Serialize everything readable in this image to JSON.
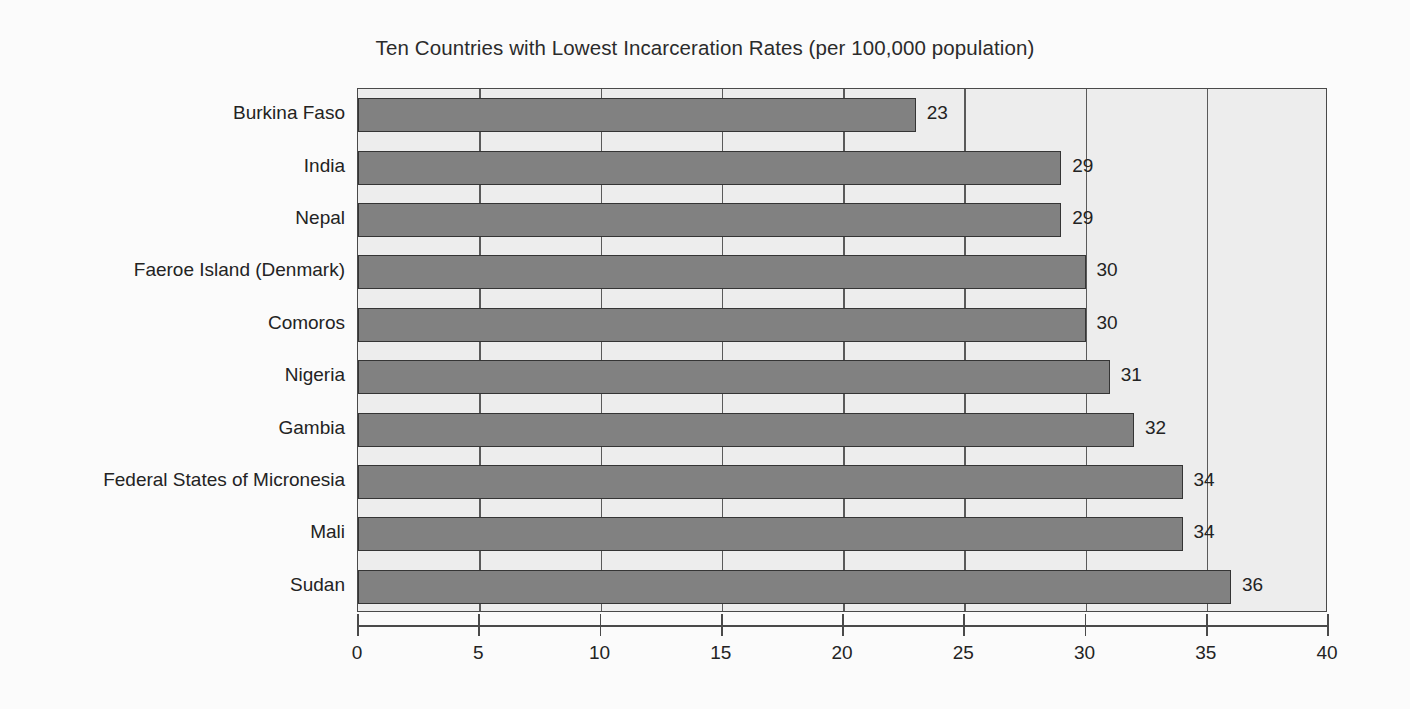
{
  "chart_data": {
    "type": "bar",
    "orientation": "horizontal",
    "title": "Ten Countries with Lowest Incarceration Rates (per 100,000 population)",
    "xlabel": "",
    "ylabel": "",
    "categories": [
      "Burkina Faso",
      "India",
      "Nepal",
      "Faeroe Island (Denmark)",
      "Comoros",
      "Nigeria",
      "Gambia",
      "Federal States of Micronesia",
      "Mali",
      "Sudan"
    ],
    "values": [
      23,
      29,
      29,
      30,
      30,
      31,
      32,
      34,
      34,
      36
    ],
    "value_labels": [
      "23",
      "29",
      "29",
      "30",
      "30",
      "31",
      "32",
      "34",
      "34",
      "36"
    ],
    "xlim": [
      0,
      40
    ],
    "xticks": [
      0,
      5,
      10,
      15,
      20,
      25,
      30,
      35,
      40
    ],
    "xtick_labels": [
      "0",
      "5",
      "10",
      "15",
      "20",
      "25",
      "30",
      "35",
      "40"
    ],
    "grid": "vertical",
    "legend": "none",
    "colors": {
      "bar_fill": "#818181",
      "bar_edge": "#353535",
      "plot_background": "#ededed",
      "page_background": "#fbfbfb",
      "axis": "#4a4a4a",
      "text": "#232323"
    }
  }
}
